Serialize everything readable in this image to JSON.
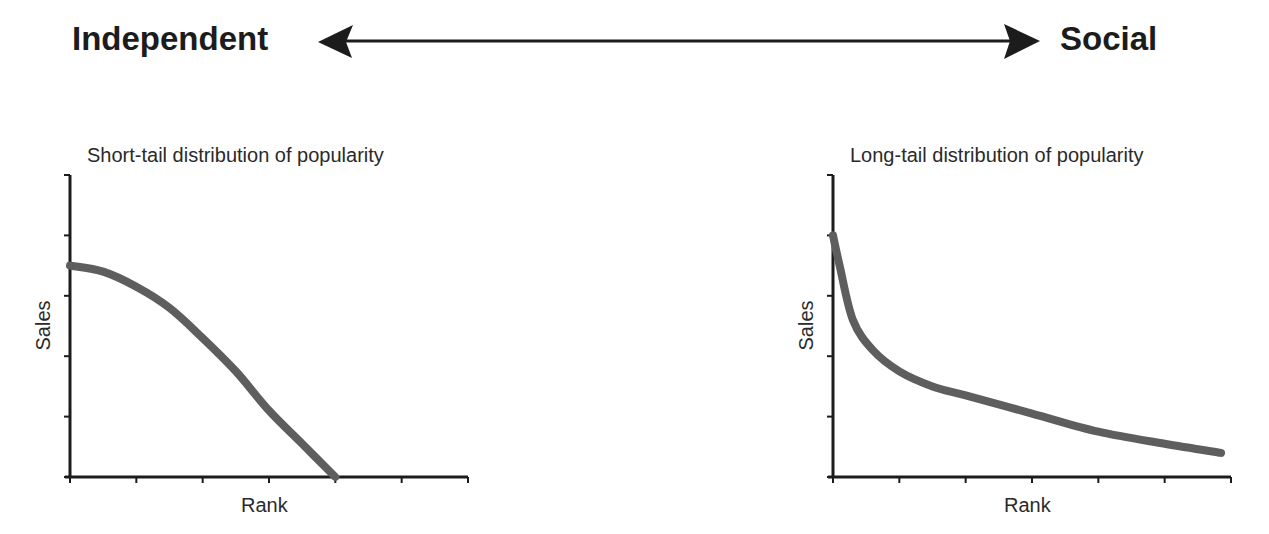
{
  "spectrum": {
    "left_label": "Independent",
    "right_label": "Social",
    "arrow": "double-headed-arrow"
  },
  "chart_data": [
    {
      "type": "line",
      "title": "Short-tail distribution of popularity",
      "xlabel": "Rank",
      "ylabel": "Sales",
      "x_ticks": 7,
      "y_ticks": 6,
      "tick_labels": false,
      "grid": false,
      "legend": null,
      "series": [
        {
          "name": "popularity",
          "x": [
            0,
            0.5,
            1,
            1.5,
            2,
            2.5,
            3,
            3.5,
            4
          ],
          "values": [
            3.5,
            3.4,
            3.15,
            2.8,
            2.3,
            1.75,
            1.1,
            0.55,
            0
          ],
          "color": "#5e5e5e"
        }
      ],
      "xlim": [
        0,
        6
      ],
      "ylim": [
        0,
        5
      ]
    },
    {
      "type": "line",
      "title": "Long-tail distribution of popularity",
      "xlabel": "Rank",
      "ylabel": "Sales",
      "x_ticks": 7,
      "y_ticks": 6,
      "tick_labels": false,
      "grid": false,
      "legend": null,
      "series": [
        {
          "name": "popularity",
          "x": [
            0,
            0.1,
            0.3,
            0.6,
            1,
            1.5,
            2,
            3,
            4,
            5,
            5.85
          ],
          "values": [
            4,
            3.5,
            2.6,
            2.1,
            1.75,
            1.5,
            1.35,
            1.05,
            0.75,
            0.55,
            0.4
          ],
          "color": "#5e5e5e"
        }
      ],
      "xlim": [
        0,
        6
      ],
      "ylim": [
        0,
        5
      ]
    }
  ]
}
